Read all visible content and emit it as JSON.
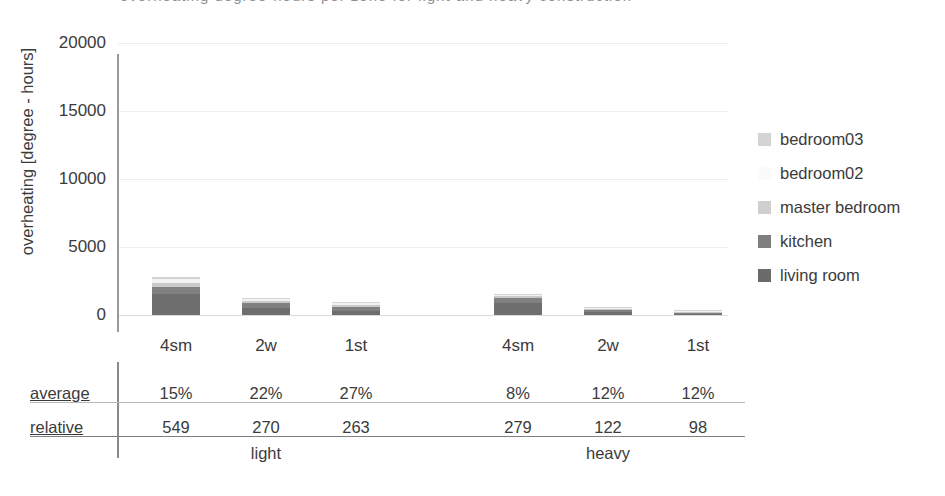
{
  "top_cutoff_text": "overheating degree-hours per zone for light and heavy construction",
  "chart_data": {
    "type": "bar",
    "stacked": true,
    "title": "",
    "xlabel": "",
    "ylabel": "overheating [degree - hours]",
    "ylim": [
      0,
      20000
    ],
    "yticks": [
      0,
      5000,
      10000,
      15000,
      20000
    ],
    "ytick_labels": [
      "0",
      "5000",
      "10000",
      "15000",
      "20000"
    ],
    "grid": true,
    "legend_position": "right",
    "categories": [
      "4sm",
      "2w",
      "1st",
      "4sm",
      "2w",
      "1st"
    ],
    "groups": [
      {
        "label": "light",
        "categories": [
          "4sm",
          "2w",
          "1st"
        ]
      },
      {
        "label": "heavy",
        "categories": [
          "4sm",
          "2w",
          "1st"
        ]
      }
    ],
    "series": [
      {
        "name": "living room",
        "color": "#6e6e6e",
        "values": [
          1550,
          520,
          330,
          900,
          200,
          110
        ]
      },
      {
        "name": "kitchen",
        "color": "#808080",
        "values": [
          480,
          330,
          280,
          330,
          140,
          60
        ]
      },
      {
        "name": "master bedroom",
        "color": "#c9c9c9",
        "values": [
          330,
          190,
          160,
          140,
          70,
          40
        ]
      },
      {
        "name": "bedroom02",
        "color": "#f2f2f2",
        "values": [
          260,
          140,
          110,
          110,
          60,
          30
        ]
      },
      {
        "name": "bedroom03",
        "color": "#d4d4d4",
        "values": [
          200,
          110,
          90,
          90,
          50,
          25
        ]
      }
    ],
    "legend": [
      {
        "label": "bedroom03",
        "color": "#d4d4d4"
      },
      {
        "label": "bedroom02",
        "color": "#fbfbfb"
      },
      {
        "label": "master bedroom",
        "color": "#cfcfcf"
      },
      {
        "label": "kitchen",
        "color": "#7f7f7f"
      },
      {
        "label": "living room",
        "color": "#6a6a6a"
      }
    ]
  },
  "table": {
    "row_labels": [
      "average",
      "relative"
    ],
    "rows": [
      {
        "label": "average",
        "values": [
          "15%",
          "22%",
          "27%",
          "8%",
          "12%",
          "12%"
        ]
      },
      {
        "label": "relative",
        "values": [
          "549",
          "270",
          "263",
          "279",
          "122",
          "98"
        ]
      }
    ],
    "group_labels": [
      "light",
      "heavy"
    ]
  }
}
